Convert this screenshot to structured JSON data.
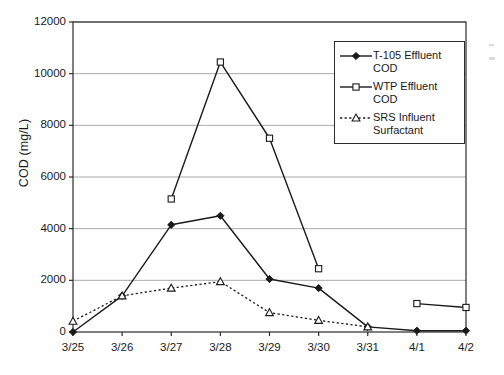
{
  "chart_data": {
    "type": "line",
    "title": "",
    "xlabel": "",
    "ylabel": "COD (mg/L)",
    "categories": [
      "3/25",
      "3/26",
      "3/27",
      "3/28",
      "3/29",
      "3/30",
      "3/31",
      "4/1",
      "4/2"
    ],
    "ylim": [
      0,
      12000
    ],
    "yticks": [
      0,
      2000,
      4000,
      6000,
      8000,
      10000,
      12000
    ],
    "ytick_labels": [
      "0",
      "2000",
      "4000",
      "6000",
      "8000",
      "10000",
      "12000"
    ],
    "grid": "horizontal",
    "legend_position": "top-right-inside",
    "series": [
      {
        "name": "T-105 Effluent COD",
        "legend_label": "T-105 Effluent\nCOD",
        "marker": "filled-diamond",
        "line_style": "solid",
        "color": "#1a1a1a",
        "values": [
          0,
          1400,
          4150,
          4500,
          2050,
          1700,
          200,
          50,
          50
        ]
      },
      {
        "name": "WTP Effluent COD",
        "legend_label": "WTP Effluent\nCOD",
        "marker": "open-square",
        "line_style": "solid",
        "color": "#1a1a1a",
        "values": [
          null,
          null,
          5150,
          10450,
          7500,
          2450,
          null,
          1100,
          950
        ]
      },
      {
        "name": "SRS Influent Surfactant",
        "legend_label": "SRS Influent\nSurfactant",
        "marker": "open-triangle",
        "line_style": "dotted",
        "color": "#1a1a1a",
        "values": [
          420,
          1400,
          1700,
          1950,
          750,
          450,
          200,
          null,
          null
        ]
      }
    ]
  },
  "axes": {
    "frame_color": "#2b2b2b",
    "grid_color": "#a9a9a9"
  }
}
